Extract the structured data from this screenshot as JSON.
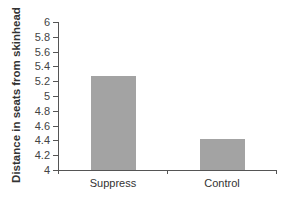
{
  "chart_data": {
    "type": "bar",
    "title": "",
    "xlabel": "",
    "ylabel": "Distance in seats from skinhead",
    "categories": [
      "Suppress",
      "Control"
    ],
    "values": [
      5.27,
      4.42
    ],
    "ylim": [
      4,
      6
    ],
    "yticks": [
      "4",
      "4.2",
      "4.4",
      "4.6",
      "4.8",
      "5",
      "5.2",
      "5.4",
      "5.6",
      "5.8",
      "6"
    ],
    "grid": false,
    "legend": null,
    "bar_color": "#a3a3a3"
  }
}
